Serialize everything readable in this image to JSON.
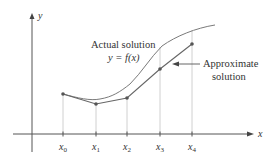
{
  "diagram": {
    "type": "euler-method-approximation",
    "axes": {
      "x_label": "x",
      "y_label": "y"
    },
    "ticks": [
      {
        "base": "x",
        "sub": "0"
      },
      {
        "base": "x",
        "sub": "1"
      },
      {
        "base": "x",
        "sub": "2"
      },
      {
        "base": "x",
        "sub": "3"
      },
      {
        "base": "x",
        "sub": "4"
      }
    ],
    "annotations": {
      "actual_line1": "Actual solution",
      "actual_line2": "y = f(x)",
      "approx_line1": "Approximate",
      "approx_line2": "solution"
    },
    "colors": {
      "axis": "#555555",
      "curve": "#777777",
      "polyline": "#666666",
      "points": "#555555",
      "guides": "#bbbbbb",
      "text": "#333333"
    }
  }
}
